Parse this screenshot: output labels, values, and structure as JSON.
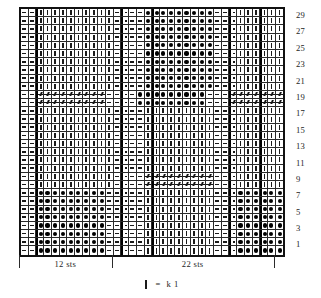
{
  "chart_data": {
    "type": "table",
    "columns": 34,
    "rows": 30,
    "row_numbers": [
      29,
      27,
      25,
      23,
      21,
      19,
      17,
      15,
      13,
      11,
      9,
      7,
      5,
      3,
      1
    ],
    "symbol_key": {
      "p": "purl-dash",
      "k": "knit-bar",
      "d": "bobble-dot",
      "c": "cable-twist-right",
      "l": "cable-twist-left",
      "b": "blank"
    },
    "grid": [
      "ppkkkkkkkkkkppppdddddddddpppkkkkkkkk",
      "ppkkkkkkkkkkppppdddddddddpppkkkkkkkk",
      "ppkkkkkkkkkkppppdddddddddpppkkkkkkkk",
      "ppkkkkkkkkkkppppdddddddddpppkkkkkkkk",
      "ppkkkkkkkkkkppppdddddddddpppkkkkkkkk",
      "ppkkkkkkkkkkppppdddddddddpppkkkkkkkk",
      "ppkkkkkkkkkkppppdddddddddpppkkkkkkkk",
      "ppkkkkkkkkkkppppdddddddddpppkkkkkkkk",
      "ppkkkkkkkkkkppppdddddddddpppkkkkkkkk",
      "ppkkkkkkkkkkppppdddddddddpppkkkkkkkk",
      "ppcccccccccppppdddddddddpppccccccccc",
      "ppcccccccccppppdddddddddpppccccccccc",
      "ppkkkkkkkkkkppppkkkkkkkkkpppkkkkkkkk",
      "ppkkkkkkkkkkppppkkkkkkkkkpppkkkkkkkk",
      "ppkkkkkkkkkkppppkkkkkkkkkpppkkkkkkkk",
      "ppkkkkkkkkkkppppkkkkkkkkkpppkkkkkkkk",
      "ppkkkkkkkkkkppppkkkkkkkkkpppkkkkkkkk",
      "ppkkkkkkkkkkppppkkkkkkkkkpppkkkkkkkk",
      "ppkkkkkkkkkkppppkkkkkkkkkpppkkkkkkkk",
      "ppkkkkkkkkkkppppkkkkkkkkkpppkkkkkkkk",
      "ppkkkkkkkkkkppppcccccccccpppkkkkkkkk",
      "ppkkkkkkkkkkppppcccccccccpppkkkkkkkk",
      "ppdddddddddpppppkkkkkkkkkpppddddddddd",
      "ppdddddddddpppppkkkkkkkkkpppddddddddd",
      "ppdddddddddpppppkkkkkkkkkpppddddddddd",
      "ppdddddddddpppppkkkkkkkkkpppddddddddd",
      "ppdddddddddpppppkkkkkkkkkpppddddddddd",
      "ppdddddddddpppppkkkkkkkkkpppddddddddd",
      "ppdddddddddpppppkkkkkkkkkpppddddddddd",
      "ppdddddddddpppppkkkkkkkkkpppddddddddd"
    ],
    "section_dividers": [
      2,
      13,
      17,
      27,
      31
    ],
    "xlabel": "",
    "ylabel": "",
    "grid_on": true,
    "legend_position": "below-chart"
  },
  "repeats": [
    {
      "label": "12 sts",
      "start_col": 1,
      "end_col": 13
    },
    {
      "label": "22 sts",
      "start_col": 13,
      "end_col": 34
    }
  ],
  "legend": {
    "glyph_name": "knit-bar",
    "equals": "=",
    "text": "k 1"
  }
}
